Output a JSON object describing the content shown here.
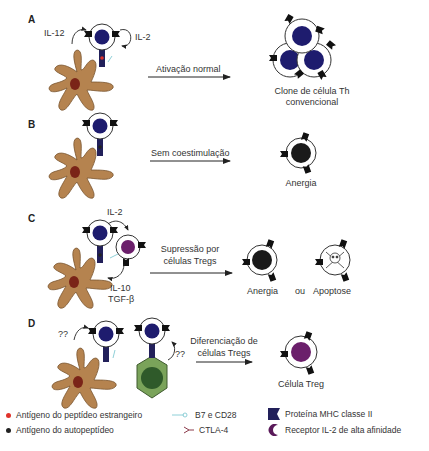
{
  "panels": {
    "A": {
      "letter": "A",
      "cytokine_left": "IL-12",
      "cytokine_right": "IL-2",
      "arrow_label": "Ativação normal",
      "result_line1": "Clone de célula Th",
      "result_line2": "convencional"
    },
    "B": {
      "letter": "B",
      "arrow_label": "Sem coestimulação",
      "result": "Anergia"
    },
    "C": {
      "letter": "C",
      "cytokine_top": "IL-2",
      "cytokine_bottom_1": "IL-10",
      "cytokine_bottom_2": "TGF-β",
      "arrow_label_1": "Supressão por",
      "arrow_label_2": "células Tregs",
      "result_left": "Anergia",
      "result_or": "ou",
      "result_right": "Apoptose"
    },
    "D": {
      "letter": "D",
      "unknown_left": "??",
      "unknown_right": "??",
      "arrow_label_1": "Diferenciação de",
      "arrow_label_2": "células Tregs",
      "result": "Célula Treg"
    }
  },
  "legend": {
    "foreign_antigen": "Antígeno do peptídeo estrangeiro",
    "self_antigen": "Antígeno do autopeptídeo",
    "b7_cd28": "B7 e CD28",
    "ctla4": "CTLA-4",
    "mhc": "Proteína MHC classe II",
    "il2r": "Receptor IL-2 de alta afinidade"
  },
  "colors": {
    "dendritic_cell": "#b5834f",
    "dendritic_nucleus": "#7a2418",
    "t_nucleus": "#1e1c6e",
    "treg_nucleus": "#6b1f6b",
    "anergic_nucleus": "#1a1a1a",
    "thymic_cell": "#7aa35a",
    "thymic_nucleus": "#2f5a2a",
    "foreign_antigen": "#e0332b",
    "self_antigen": "#222222",
    "b7": "#8fd0d8",
    "mhc": "#22205a"
  }
}
